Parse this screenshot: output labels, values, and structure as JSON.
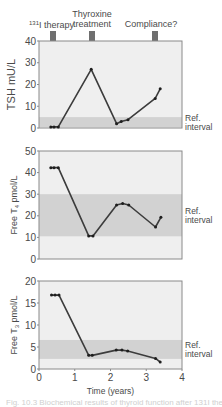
{
  "figure": {
    "caption": "Fig. 10.3 Biochemical results of thyroid function after 131I therapy",
    "colors": {
      "plot_bg": "#efefef",
      "ref_band": "#d2d2d2",
      "frame": "#8a8a8a",
      "line": "#3c3c3c",
      "arrow": "#6f6f6f",
      "text": "#4a4a4a"
    },
    "annotations": [
      {
        "label_sup": "131",
        "label": "I therapy",
        "x": 0.4
      },
      {
        "label_line1": "Thyroxine",
        "label_line2": "treatment",
        "x": 1.5
      },
      {
        "label": "Compliance?",
        "x": 3.3
      }
    ],
    "ref_label_line1": "Ref.",
    "ref_label_line2": "interval"
  },
  "chart_data": [
    {
      "type": "line",
      "title": "TSH",
      "xlabel": "",
      "ylabel": "TSH mU/L",
      "ylim": [
        0,
        40
      ],
      "yticks": [
        0,
        10,
        20,
        30,
        40
      ],
      "xlim": [
        0,
        4
      ],
      "ref_interval": [
        0.4,
        5
      ],
      "x": [
        0.33,
        0.42,
        0.54,
        1.46,
        2.17,
        2.3,
        2.49,
        3.25,
        3.39
      ],
      "values": [
        0.5,
        0.5,
        0.5,
        27,
        2,
        3,
        3.8,
        13.6,
        18
      ],
      "annotations": [
        "131I therapy",
        "Thyroxine treatment",
        "Compliance?"
      ],
      "grid": false
    },
    {
      "type": "line",
      "title": "Free T4",
      "xlabel": "",
      "ylabel": "Free T4 pmol/L",
      "ylim": [
        0,
        50
      ],
      "yticks": [
        0,
        10,
        20,
        30,
        40,
        50
      ],
      "xlim": [
        0,
        4
      ],
      "ref_interval": [
        10.5,
        30
      ],
      "x": [
        0.33,
        0.42,
        0.54,
        1.39,
        1.51,
        2.17,
        2.34,
        2.51,
        3.26,
        3.41
      ],
      "values": [
        42.3,
        42.3,
        42.3,
        10.7,
        10.7,
        25,
        25.7,
        25,
        14.8,
        19.3
      ],
      "grid": false
    },
    {
      "type": "line",
      "title": "Free T3",
      "xlabel": "Time (years)",
      "ylabel": "Free T3 pmol/L",
      "ylim": [
        0,
        20
      ],
      "yticks": [
        0,
        5,
        10,
        15,
        20
      ],
      "xlim": [
        0,
        4
      ],
      "xticks": [
        0,
        1,
        2,
        3,
        4
      ],
      "ref_interval": [
        2.3,
        6.6
      ],
      "x": [
        0.35,
        0.45,
        0.56,
        1.39,
        1.49,
        2.16,
        2.32,
        2.48,
        3.26,
        3.39
      ],
      "values": [
        16.8,
        16.8,
        16.8,
        3.1,
        3.1,
        4.3,
        4.3,
        4.1,
        2.4,
        1.6
      ],
      "grid": false
    }
  ]
}
